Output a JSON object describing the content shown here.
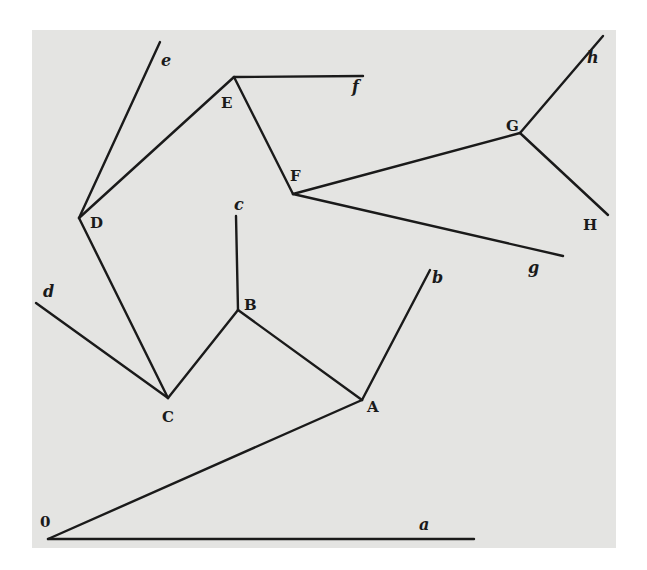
{
  "figure": {
    "type": "vector-polygon-diagram",
    "background": "#e4e4e2",
    "line_color": "#1a1a1a"
  },
  "nodes": [
    {
      "id": "O",
      "label": "0",
      "x": 48,
      "y": 539,
      "label_x": 40,
      "label_y": 527
    },
    {
      "id": "A",
      "label": "A",
      "x": 362,
      "y": 400,
      "label_x": 367,
      "label_y": 412
    },
    {
      "id": "B",
      "label": "B",
      "x": 238,
      "y": 310,
      "label_x": 244,
      "label_y": 310
    },
    {
      "id": "C",
      "label": "C",
      "x": 168,
      "y": 398,
      "label_x": 162,
      "label_y": 422
    },
    {
      "id": "D",
      "label": "D",
      "x": 79,
      "y": 218,
      "label_x": 90,
      "label_y": 228
    },
    {
      "id": "E",
      "label": "E",
      "x": 234,
      "y": 77,
      "label_x": 221,
      "label_y": 108
    },
    {
      "id": "F",
      "label": "F",
      "x": 293,
      "y": 194,
      "label_x": 290,
      "label_y": 181
    },
    {
      "id": "G",
      "label": "G",
      "x": 520,
      "y": 133,
      "label_x": 506,
      "label_y": 131
    },
    {
      "id": "H",
      "label": "H",
      "x": 608,
      "y": 215,
      "label_x": 583,
      "label_y": 230
    }
  ],
  "endpoints": [
    {
      "id": "a",
      "label": "a",
      "x": 474,
      "y": 539,
      "label_x": 419,
      "label_y": 530
    },
    {
      "id": "b",
      "label": "b",
      "x": 430,
      "y": 270,
      "label_x": 432,
      "label_y": 283
    },
    {
      "id": "c",
      "label": "c",
      "x": 236,
      "y": 216,
      "label_x": 234,
      "label_y": 210
    },
    {
      "id": "d",
      "label": "d",
      "x": 36,
      "y": 303,
      "label_x": 43,
      "label_y": 297
    },
    {
      "id": "e",
      "label": "e",
      "x": 160,
      "y": 42,
      "label_x": 161,
      "label_y": 66
    },
    {
      "id": "f",
      "label": "f",
      "x": 363,
      "y": 76,
      "label_x": 352,
      "label_y": 92
    },
    {
      "id": "g",
      "label": "g",
      "x": 563,
      "y": 256,
      "label_x": 528,
      "label_y": 273
    },
    {
      "id": "h",
      "label": "h",
      "x": 603,
      "y": 36,
      "label_x": 587,
      "label_y": 63
    }
  ],
  "edges": [
    {
      "from": "O",
      "to": "a"
    },
    {
      "from": "O",
      "to": "A"
    },
    {
      "from": "A",
      "to": "b"
    },
    {
      "from": "A",
      "to": "B"
    },
    {
      "from": "B",
      "to": "c"
    },
    {
      "from": "B",
      "to": "C"
    },
    {
      "from": "C",
      "to": "d"
    },
    {
      "from": "C",
      "to": "D"
    },
    {
      "from": "D",
      "to": "e"
    },
    {
      "from": "D",
      "to": "E"
    },
    {
      "from": "E",
      "to": "f"
    },
    {
      "from": "E",
      "to": "F"
    },
    {
      "from": "F",
      "to": "g"
    },
    {
      "from": "F",
      "to": "G"
    },
    {
      "from": "G",
      "to": "h"
    },
    {
      "from": "G",
      "to": "H"
    }
  ]
}
